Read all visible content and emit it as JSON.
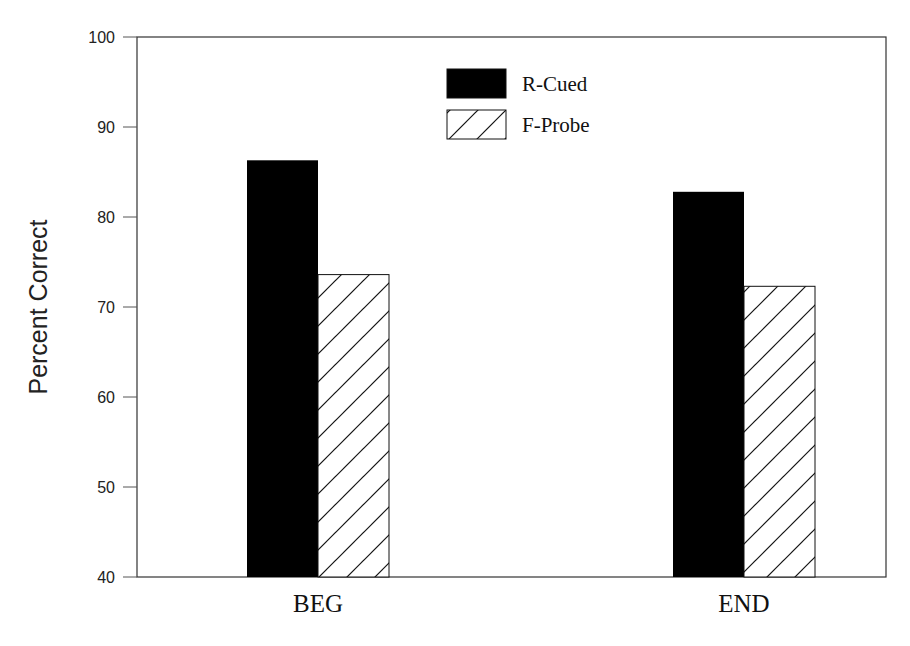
{
  "chart_data": {
    "type": "bar",
    "title": "",
    "xlabel": "",
    "ylabel": "Percent Correct",
    "ylim": [
      40,
      100
    ],
    "yticks": [
      40,
      50,
      60,
      70,
      80,
      90,
      100
    ],
    "grid": false,
    "legend_position": "top-center",
    "categories": [
      "BEG",
      "END"
    ],
    "series": [
      {
        "name": "R-Cued",
        "fill": "solid",
        "color": "#000000",
        "values": [
          86.3,
          82.8
        ]
      },
      {
        "name": "F-Probe",
        "fill": "hatch",
        "color": "#ffffff",
        "values": [
          73.6,
          72.3
        ]
      }
    ]
  }
}
